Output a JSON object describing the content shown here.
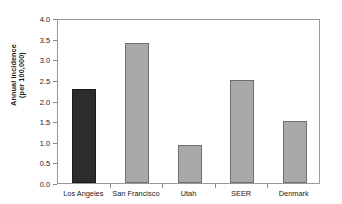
{
  "chart_data": {
    "type": "bar",
    "title": "",
    "subtitle": "",
    "xlabel": "",
    "ylabel": "Annual incidence (per 100,000)",
    "ylabel_lines": [
      "Annual incidence",
      "(per 100,000)"
    ],
    "categories": [
      "Los Angeles",
      "San Francisco",
      "Utah",
      "SEER",
      "Denmark"
    ],
    "values": [
      2.28,
      3.4,
      0.91,
      2.5,
      1.5
    ],
    "bar_colors": [
      "#2c2c2c",
      "#a9a9a9",
      "#a9a9a9",
      "#a9a9a9",
      "#a9a9a9"
    ],
    "ylim": [
      0.0,
      4.0
    ],
    "ytick_values": [
      0.0,
      0.5,
      1.0,
      1.5,
      2.0,
      2.5,
      3.0,
      3.5,
      4.0
    ],
    "ytick_labels": [
      "0.0",
      "0.5",
      "1.0",
      "1.5",
      "2.0",
      "2.5",
      "3.0",
      "3.5",
      "4.0"
    ],
    "grid": false,
    "legend": false,
    "legend_position": "none",
    "frame": true
  },
  "colors": {
    "background": "#ffffff",
    "plot_background": "#ffffff",
    "frame": "#9a9a9a",
    "bar_gray": "#a9a9a9",
    "bar_gray_edge": "#6f6f6f",
    "bar_dark": "#2c2c2c",
    "bar_dark_edge": "#1a1a1a",
    "text": "#1a1a1a",
    "tick": "#8a8a8a"
  }
}
